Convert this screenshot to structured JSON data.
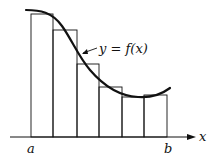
{
  "diagram": {
    "title": "",
    "curve_label": "y = f(x)",
    "axis_label": "x",
    "left_endpoint_label": "a",
    "right_endpoint_label": "b",
    "num_rectangles": 6,
    "rectangle_rule": "left-endpoint",
    "colors": {
      "stroke": "#111111",
      "background": "#ffffff"
    }
  }
}
